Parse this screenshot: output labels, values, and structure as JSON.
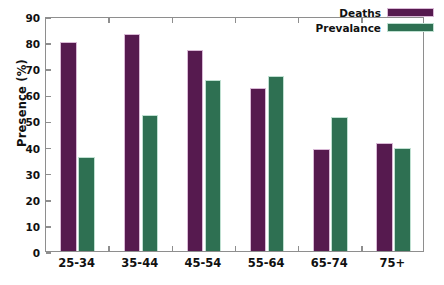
{
  "chart_data": {
    "type": "bar",
    "title": "",
    "xlabel": "",
    "ylabel": "Presence (%)",
    "categories": [
      "25-34",
      "35-44",
      "45-54",
      "55-64",
      "65-74",
      "75+"
    ],
    "series": [
      {
        "name": "Deaths",
        "color": "#561a4f",
        "values": [
          80,
          83,
          77,
          62.5,
          39,
          41.5
        ]
      },
      {
        "name": "Prevalance",
        "color": "#2e7052",
        "values": [
          36,
          52,
          65.5,
          67,
          51.5,
          39.5
        ]
      }
    ],
    "ylim": [
      0,
      90
    ],
    "yticks": [
      0,
      10,
      20,
      30,
      40,
      50,
      60,
      70,
      80,
      90
    ],
    "ytick_labels": [
      "0",
      "10",
      "20",
      "30",
      "40",
      "50",
      "60",
      "70",
      "80",
      "90"
    ],
    "grid": false,
    "legend_position": "top-right",
    "legend_entries": [
      "Deaths",
      "Prevalance"
    ],
    "frame_color": "#8e8e8e",
    "background_color": "#ffffff"
  }
}
